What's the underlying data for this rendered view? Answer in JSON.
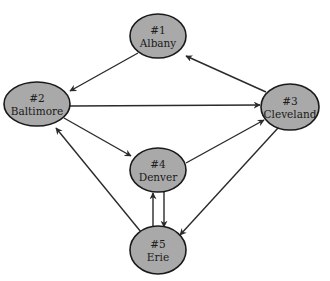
{
  "colors": {
    "node_fill": "#a9a9a9",
    "node_stroke": "#1a1a1a",
    "edge": "#2a2a2a",
    "background": "#ffffff"
  },
  "nodes": [
    {
      "id": "n1",
      "number": "#1",
      "label": "Albany",
      "cx": 158,
      "cy": 36,
      "rx": 28,
      "ry": 22
    },
    {
      "id": "n2",
      "number": "#2",
      "label": "Baltimore",
      "cx": 37,
      "cy": 104,
      "rx": 33,
      "ry": 22
    },
    {
      "id": "n3",
      "number": "#3",
      "label": "Cleveland",
      "cx": 290,
      "cy": 107,
      "rx": 29,
      "ry": 23
    },
    {
      "id": "n4",
      "number": "#4",
      "label": "Denver",
      "cx": 158,
      "cy": 170,
      "rx": 28,
      "ry": 22
    },
    {
      "id": "n5",
      "number": "#5",
      "label": "Erie",
      "cx": 158,
      "cy": 250,
      "rx": 28,
      "ry": 24
    }
  ],
  "edges": [
    {
      "from": "Albany",
      "to": "Baltimore",
      "x1": 138,
      "y1": 53,
      "x2": 70,
      "y2": 91
    },
    {
      "from": "Cleveland",
      "to": "Albany",
      "x1": 266,
      "y1": 92,
      "x2": 186,
      "y2": 56
    },
    {
      "from": "Baltimore",
      "to": "Cleveland",
      "x1": 70,
      "y1": 106,
      "x2": 260,
      "y2": 105
    },
    {
      "from": "Baltimore",
      "to": "Denver",
      "x1": 64,
      "y1": 118,
      "x2": 131,
      "y2": 156
    },
    {
      "from": "Denver",
      "to": "Cleveland",
      "x1": 186,
      "y1": 163,
      "x2": 264,
      "y2": 120
    },
    {
      "from": "Cleveland",
      "to": "Erie",
      "x1": 278,
      "y1": 128,
      "x2": 180,
      "y2": 235
    },
    {
      "from": "Erie",
      "to": "Baltimore",
      "x1": 141,
      "y1": 232,
      "x2": 56,
      "y2": 128
    },
    {
      "from": "Erie",
      "to": "Denver",
      "x1": 153,
      "y1": 228,
      "x2": 153,
      "y2": 193
    },
    {
      "from": "Denver",
      "to": "Erie",
      "x1": 164,
      "y1": 192,
      "x2": 164,
      "y2": 227
    }
  ]
}
